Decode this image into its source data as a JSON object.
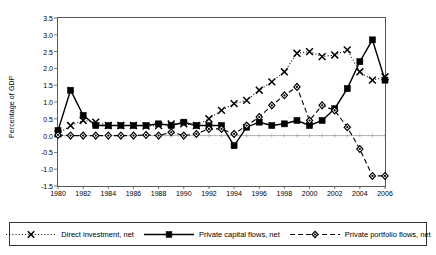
{
  "chart_data": {
    "type": "line",
    "title": "",
    "xlabel": "",
    "ylabel": "Percentage of GDP",
    "xlim": [
      1980,
      2006
    ],
    "ylim": [
      -1.5,
      3.5
    ],
    "ytick_step": 0.5,
    "xtick_step": 2,
    "grid": false,
    "legend_position": "bottom",
    "x": [
      1980,
      1981,
      1982,
      1983,
      1984,
      1985,
      1986,
      1987,
      1988,
      1989,
      1990,
      1991,
      1992,
      1993,
      1994,
      1995,
      1996,
      1997,
      1998,
      1999,
      2000,
      2001,
      2002,
      2003,
      2004,
      2005,
      2006
    ],
    "ytick_labels": [
      "3.5",
      "3.0",
      "2.5",
      "2.0",
      "1.5",
      "1.0",
      "0.5",
      "0.0",
      "-0.5",
      "-1.0",
      "-1.5"
    ],
    "ytick_values": [
      3.5,
      3.0,
      2.5,
      2.0,
      1.5,
      1.0,
      0.5,
      0.0,
      -0.5,
      -1.0,
      -1.5
    ],
    "xtick_labels": [
      "1980",
      "1982",
      "1984",
      "1986",
      "1988",
      "1990",
      "1992",
      "1994",
      "1996",
      "1998",
      "2000",
      "2002",
      "2004",
      "2006"
    ],
    "xtick_values": [
      1980,
      1982,
      1984,
      1986,
      1988,
      1990,
      1992,
      1994,
      1996,
      1998,
      2000,
      2002,
      2004,
      2006
    ],
    "series": [
      {
        "name": "Direct investment, net",
        "marker": "x",
        "line_style": "dotted",
        "color": "#000000",
        "values": [
          0.05,
          0.3,
          0.45,
          0.4,
          0.3,
          0.3,
          0.3,
          0.28,
          0.3,
          0.35,
          0.35,
          0.3,
          0.5,
          0.75,
          0.95,
          1.05,
          1.35,
          1.6,
          1.9,
          2.45,
          2.5,
          2.35,
          2.4,
          2.55,
          1.9,
          1.65,
          1.75
        ]
      },
      {
        "name": "Private capital flows, net",
        "marker": "square",
        "line_style": "solid",
        "color": "#000000",
        "values": [
          0.15,
          1.35,
          0.6,
          0.3,
          0.3,
          0.3,
          0.3,
          0.3,
          0.35,
          0.3,
          0.4,
          0.3,
          0.3,
          0.3,
          -0.3,
          0.25,
          0.4,
          0.3,
          0.35,
          0.45,
          0.3,
          0.45,
          0.8,
          1.4,
          2.2,
          2.85,
          1.65
        ]
      },
      {
        "name": "Private portfolio flows, net",
        "marker": "diamond",
        "line_style": "dashed",
        "color": "#000000",
        "values": [
          0.02,
          0.0,
          0.0,
          0.0,
          0.0,
          0.0,
          0.0,
          0.02,
          0.0,
          0.1,
          0.0,
          0.05,
          0.2,
          0.2,
          0.05,
          0.3,
          0.55,
          0.9,
          1.2,
          1.45,
          0.45,
          0.9,
          0.75,
          0.25,
          -0.4,
          -1.2,
          -1.2
        ]
      }
    ]
  },
  "legend": {
    "items": [
      {
        "label": "Direct investment, net",
        "key": "dotted-x-key"
      },
      {
        "label": "Private capital flows, net",
        "key": "solid-square-key"
      },
      {
        "label": "Private portfolio flows, net",
        "key": "dashed-diamond-key"
      }
    ]
  }
}
